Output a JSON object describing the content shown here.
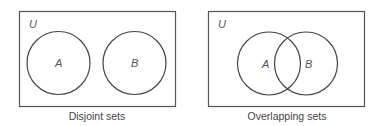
{
  "diagrams": [
    {
      "caption": "Disjoint sets",
      "universe_label": "U",
      "sets": [
        {
          "label": "A"
        },
        {
          "label": "B"
        }
      ]
    },
    {
      "caption": "Overlapping sets",
      "universe_label": "U",
      "sets": [
        {
          "label": "A"
        },
        {
          "label": "B"
        }
      ]
    }
  ],
  "colors": {
    "stroke": "#444444",
    "text": "#555555",
    "background": "#ffffff"
  }
}
